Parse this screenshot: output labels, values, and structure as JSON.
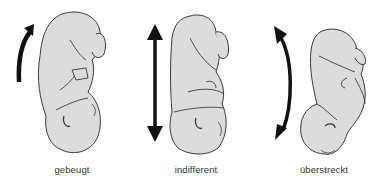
{
  "figure": {
    "panels": [
      {
        "id": "flexed",
        "label": "gebeugt",
        "arrow": "curved-up-arrow",
        "posture": "flexed-fetus"
      },
      {
        "id": "neutral",
        "label": "indifferent",
        "arrow": "double-vertical-arrow",
        "posture": "neutral-fetus"
      },
      {
        "id": "extended",
        "label": "überstreckt",
        "arrow": "curved-double-arrow",
        "posture": "extended-fetus"
      }
    ],
    "colors": {
      "body_fill": "#dcdcdc",
      "outline": "#3a3a3a",
      "arrow": "#111111",
      "text": "#333333"
    }
  }
}
